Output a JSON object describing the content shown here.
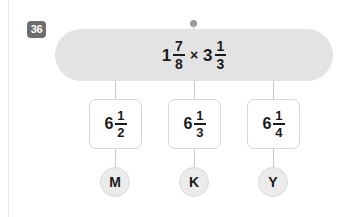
{
  "question": {
    "number": "36",
    "expression": {
      "left": {
        "whole": "1",
        "numerator": "7",
        "denominator": "8"
      },
      "operator": "×",
      "right": {
        "whole": "3",
        "numerator": "1",
        "denominator": "3"
      }
    }
  },
  "options": [
    {
      "letter": "M",
      "value": {
        "whole": "6",
        "numerator": "1",
        "denominator": "2"
      }
    },
    {
      "letter": "K",
      "value": {
        "whole": "6",
        "numerator": "1",
        "denominator": "3"
      }
    },
    {
      "letter": "Y",
      "value": {
        "whole": "6",
        "numerator": "1",
        "denominator": "4"
      }
    }
  ],
  "colors": {
    "banner": "#e3e3e3",
    "badge": "#6e6e6e",
    "connector": "#c9c9c9",
    "bubble": "#ebebeb",
    "text": "#1b1b1b"
  }
}
